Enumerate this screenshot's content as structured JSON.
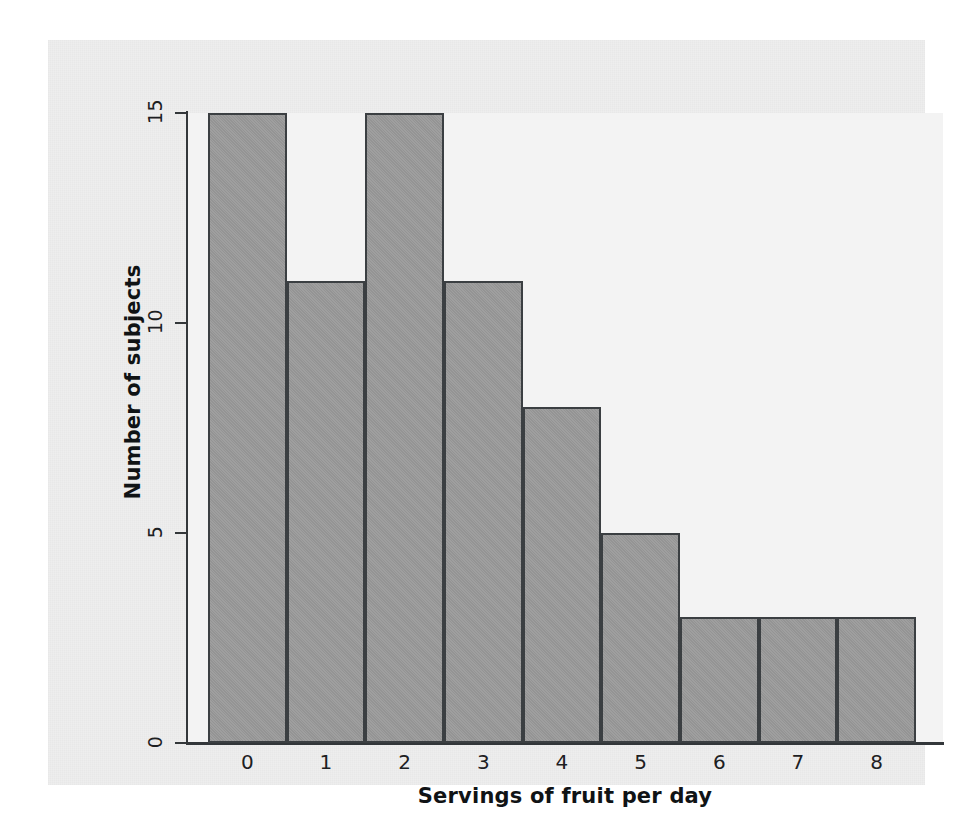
{
  "figure": {
    "background_color": "#eeeeee",
    "plot_background_color": "#f3f3f3",
    "bar_fill_color": "#9a9a9a",
    "bar_border_color": "#3b3f42",
    "axis_color": "#33373a"
  },
  "chart_data": {
    "type": "bar",
    "title": "",
    "subtitle": "",
    "xlabel": "Servings of fruit per day",
    "ylabel": "Number of subjects",
    "categories": [
      "0",
      "1",
      "2",
      "3",
      "4",
      "5",
      "6",
      "7",
      "8"
    ],
    "values": [
      15,
      11,
      15,
      11,
      8,
      5,
      3,
      3,
      3
    ],
    "ylim": [
      0,
      15
    ],
    "xlim": [
      -0.5,
      8.5
    ],
    "yticks": [
      "0",
      "5",
      "10",
      "15"
    ],
    "ytick_values": [
      0,
      5,
      10,
      15
    ],
    "xticks": [
      "0",
      "1",
      "2",
      "3",
      "4",
      "5",
      "6",
      "7",
      "8"
    ],
    "grid": false,
    "legend": null,
    "annotations": []
  }
}
